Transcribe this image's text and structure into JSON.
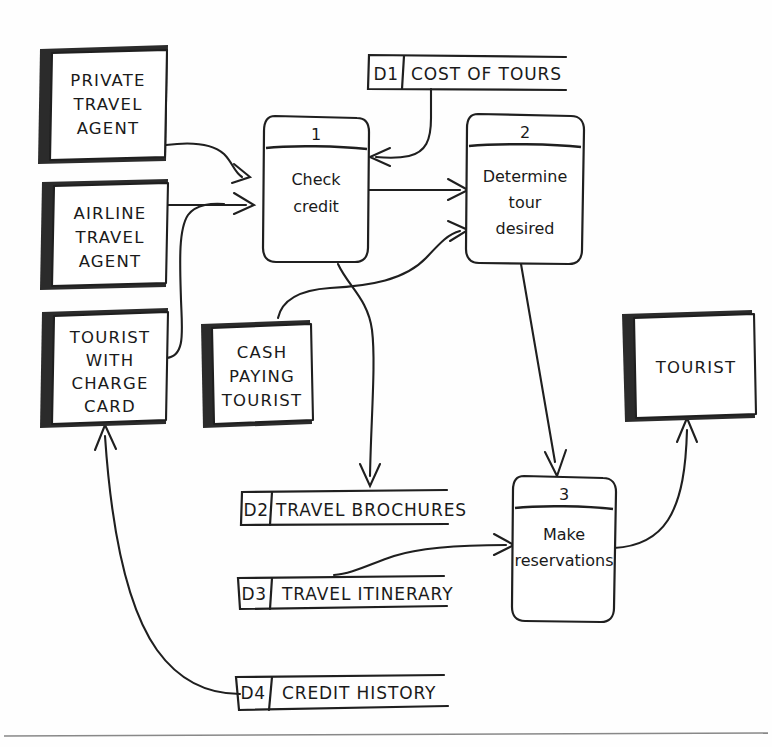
{
  "diagram": {
    "style": "hand-drawn",
    "ink_color": "#1f1f1f",
    "paper_color": "#fefefe",
    "shadow_color": "#2b2b2b"
  },
  "external_entities": [
    {
      "id": "ee-private-travel-agent",
      "lines": [
        "PRIVATE",
        "TRAVEL",
        "AGENT"
      ]
    },
    {
      "id": "ee-airline-travel-agent",
      "lines": [
        "AIRLINE",
        "TRAVEL",
        "AGENT"
      ]
    },
    {
      "id": "ee-tourist-with-charge-card",
      "lines": [
        "TOURIST",
        "WITH",
        "CHARGE",
        "CARD"
      ]
    },
    {
      "id": "ee-cash-paying-tourist",
      "lines": [
        "CASH",
        "PAYING",
        "TOURIST"
      ]
    },
    {
      "id": "ee-tourist",
      "lines": [
        "TOURIST"
      ]
    }
  ],
  "processes": [
    {
      "id": "process-1",
      "number": "1",
      "lines": [
        "Check",
        "credit"
      ]
    },
    {
      "id": "process-2",
      "number": "2",
      "lines": [
        "Determine",
        "tour",
        "desired"
      ]
    },
    {
      "id": "process-3",
      "number": "3",
      "lines": [
        "Make",
        "reservations"
      ]
    }
  ],
  "data_stores": [
    {
      "id": "store-d1",
      "code": "D1",
      "label": "COST OF TOURS"
    },
    {
      "id": "store-d2",
      "code": "D2",
      "label": "TRAVEL BROCHURES"
    },
    {
      "id": "store-d3",
      "code": "D3",
      "label": "TRAVEL ITINERARY"
    },
    {
      "id": "store-d4",
      "code": "D4",
      "label": "CREDIT HISTORY"
    }
  ],
  "flows": [
    {
      "id": "flow-private-agent-to-check-credit",
      "from": "PRIVATE TRAVEL AGENT",
      "to": "Check credit"
    },
    {
      "id": "flow-airline-agent-to-check-credit",
      "from": "AIRLINE TRAVEL AGENT",
      "to": "Check credit"
    },
    {
      "id": "flow-charge-card-tourist-to-check-credit",
      "from": "TOURIST WITH CHARGE CARD",
      "to": "Check credit"
    },
    {
      "id": "flow-cost-of-tours-to-check-credit",
      "from": "D1 COST OF TOURS",
      "to": "Check credit"
    },
    {
      "id": "flow-check-credit-to-determine-tour",
      "from": "Check credit",
      "to": "Determine tour desired"
    },
    {
      "id": "flow-cash-paying-tourist-to-determine-tour",
      "from": "CASH PAYING TOURIST",
      "to": "Determine tour desired"
    },
    {
      "id": "flow-check-credit-to-travel-brochures",
      "from": "Check credit",
      "to": "D2 TRAVEL BROCHURES"
    },
    {
      "id": "flow-determine-tour-to-make-reservations",
      "from": "Determine tour desired",
      "to": "Make reservations"
    },
    {
      "id": "flow-travel-itinerary-to-make-reservations",
      "from": "D3 TRAVEL ITINERARY",
      "to": "Make reservations"
    },
    {
      "id": "flow-make-reservations-to-tourist",
      "from": "Make reservations",
      "to": "TOURIST"
    },
    {
      "id": "flow-credit-history-to-charge-card-tourist",
      "from": "D4 CREDIT HISTORY",
      "to": "TOURIST WITH CHARGE CARD"
    }
  ]
}
